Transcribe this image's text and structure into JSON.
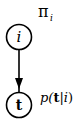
{
  "diagram": {
    "type": "graphical-model",
    "nodes": [
      {
        "id": "i",
        "label": "i",
        "style": "italic"
      },
      {
        "id": "t",
        "label": "t",
        "style": "bold"
      }
    ],
    "edges": [
      {
        "from": "i",
        "to": "t",
        "label": "p(t|i)"
      }
    ],
    "annotations": {
      "prior": {
        "symbol": "π",
        "subscript": "i"
      },
      "conditional": {
        "prefix": "p(",
        "bold": "t",
        "bar": "|",
        "var": "i",
        "suffix": ")"
      }
    },
    "colors": {
      "stroke": "#000000",
      "background": "#ffffff"
    }
  }
}
